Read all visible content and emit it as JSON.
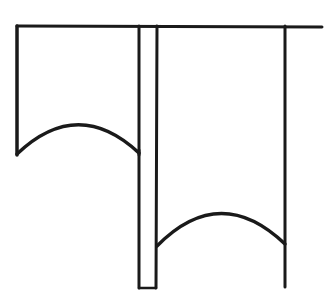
{
  "diagram": {
    "title": "",
    "stroke_color": "#1a1a1a",
    "background": "#ffffff",
    "stroke_width": 3,
    "top_bar": {
      "x1": 17,
      "y1": 26,
      "x2": 322,
      "y2": 27
    },
    "left_panel": {
      "left_x": 17,
      "right_x": 139,
      "top_y": 26,
      "arch": {
        "start": [
          17,
          154
        ],
        "control": [
          78,
          96
        ],
        "end": [
          139,
          153
        ]
      }
    },
    "narrow_strip": {
      "left_x": 140,
      "right_x": 156,
      "top_y": 26,
      "bottom_y": 288
    },
    "right_panel": {
      "left_x": 157,
      "right_x": 285,
      "top_y": 26,
      "bottom_y": 288,
      "arch": {
        "start": [
          157,
          246
        ],
        "control": [
          220,
          182
        ],
        "end": [
          285,
          244
        ]
      }
    }
  }
}
